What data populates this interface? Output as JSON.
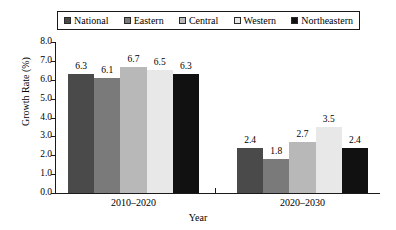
{
  "chart_data": {
    "type": "bar",
    "title": "",
    "xlabel": "Year",
    "ylabel": "Growth Rate (%)",
    "ylim": [
      0.0,
      8.0
    ],
    "ytick_labels": [
      "0.0",
      "1.0",
      "2.0",
      "3.0",
      "4.0",
      "5.0",
      "6.0",
      "7.0",
      "8.0"
    ],
    "ytick_values": [
      0.0,
      1.0,
      2.0,
      3.0,
      4.0,
      5.0,
      6.0,
      7.0,
      8.0
    ],
    "grid": false,
    "legend_position": "top",
    "categories": [
      "2010–2020",
      "2020–2030"
    ],
    "series": [
      {
        "name": "National",
        "color": "#4a4a4a",
        "values": [
          6.3,
          2.4
        ],
        "labels": [
          "6.3",
          "2.4"
        ]
      },
      {
        "name": "Eastern",
        "color": "#7a7a7a",
        "values": [
          6.1,
          1.8
        ],
        "labels": [
          "6.1",
          "1.8"
        ]
      },
      {
        "name": "Central",
        "color": "#b8b8b8",
        "values": [
          6.7,
          2.7
        ],
        "labels": [
          "6.7",
          "2.7"
        ]
      },
      {
        "name": "Western",
        "color": "#e8e8e8",
        "values": [
          6.5,
          3.5
        ],
        "labels": [
          "6.5",
          "3.5"
        ]
      },
      {
        "name": "Northeastern",
        "color": "#111111",
        "values": [
          6.3,
          2.4
        ],
        "labels": [
          "2.4",
          "2.4"
        ]
      }
    ]
  },
  "legend": {
    "entries": [
      {
        "label": "National",
        "swatch": "#4a4a4a"
      },
      {
        "label": "Eastern",
        "swatch": "#7a7a7a"
      },
      {
        "label": "Central",
        "swatch": "#b8b8b8"
      },
      {
        "label": "Western",
        "swatch": "#e8e8e8"
      },
      {
        "label": "Northeastern",
        "swatch": "#111111"
      }
    ]
  },
  "axes": {
    "y_title": "Growth Rate (%)",
    "x_title": "Year"
  }
}
